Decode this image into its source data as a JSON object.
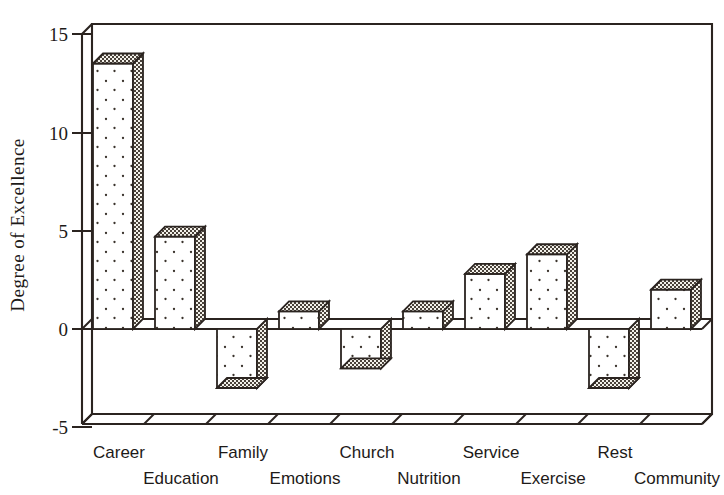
{
  "chart_data": {
    "type": "bar",
    "title": "",
    "subtitle": "",
    "xlabel": "",
    "ylabel": "Degree of Excellence",
    "categories": [
      "Career",
      "Education",
      "Family",
      "Emotions",
      "Church",
      "Nutrition",
      "Service",
      "Exercise",
      "Rest",
      "Community"
    ],
    "values": [
      13.5,
      4.7,
      -3.0,
      0.9,
      -2.0,
      0.9,
      2.8,
      3.8,
      -3.0,
      2.0
    ],
    "ylim": [
      -5,
      15
    ],
    "yticks": [
      15,
      10,
      5,
      0,
      -5
    ],
    "ytick_labels": [
      "15",
      "10",
      "5",
      "0",
      "-5"
    ],
    "grid": false,
    "legend": "none",
    "style": "3d-bar",
    "bar_front_pattern": "sparse-dots",
    "bar_side_pattern": "checker",
    "colors": {
      "line": "#2b2420",
      "bar_front": "#ffffff",
      "bar_side": "#efece6",
      "background": "#ffffff",
      "text": "#1d1a18"
    }
  }
}
